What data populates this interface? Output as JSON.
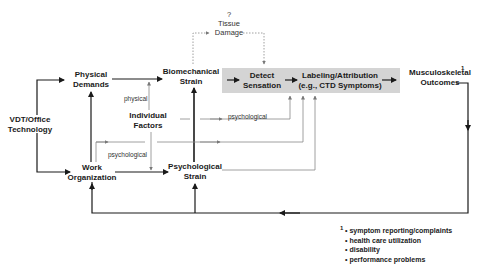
{
  "diagram": {
    "nodes": {
      "vdt": [
        "VDT/Office",
        "Technology"
      ],
      "physical_demands": [
        "Physical",
        "Demands"
      ],
      "work_organization": [
        "Work",
        "Organization"
      ],
      "individual_factors": [
        "Individual",
        "Factors"
      ],
      "biomechanical_strain": [
        "Biomechanical",
        "Strain"
      ],
      "psychological_strain": [
        "Psychological",
        "Strain"
      ],
      "detect_sensation": [
        "Detect",
        "Sensation"
      ],
      "labeling": [
        "Labeling/Attribution",
        "(e.g., CTD Symptoms)"
      ],
      "outcomes": [
        "Musculoskeletal",
        "Outcomes"
      ],
      "tissue_damage": [
        "?",
        "Tissue",
        "Damage"
      ]
    },
    "edge_labels": {
      "physical": "physical",
      "psychological_to_sensation": "psychological",
      "psychological_to_work": "psychological"
    },
    "outcomes_footnote_mark": "1",
    "footnote": {
      "mark": "1",
      "items": [
        "symptom reporting/complaints",
        "health care utilization",
        "disability",
        "performance problems"
      ]
    },
    "colors": {
      "process_box": "#d4d4d4",
      "line_dark": "#1a1a1a",
      "line_light": "#8a8a8a"
    }
  }
}
